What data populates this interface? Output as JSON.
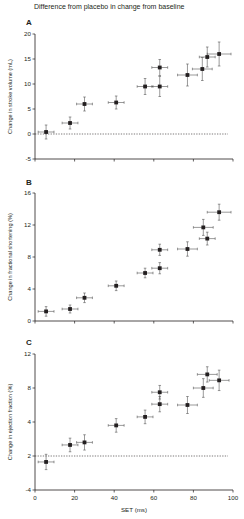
{
  "figure": {
    "title": "Difference from placebo in change from baseline",
    "xlabel": "SET (ms)"
  },
  "chart_data": [
    {
      "type": "scatter",
      "panel": "A",
      "title": "",
      "xlabel": "",
      "ylabel": "Change in stroke volume (mL)",
      "xlim": [
        0,
        100
      ],
      "ylim": [
        -5,
        20
      ],
      "yticks": [
        "-5",
        "0",
        "5",
        "10",
        "15",
        "20"
      ],
      "ytick_values": [
        -5,
        0,
        5,
        10,
        15,
        20
      ],
      "xticks": [
        0,
        20,
        40,
        60,
        80,
        100
      ],
      "xtick_labels_shown": false,
      "reference_line": {
        "y": 0,
        "style": "dashed"
      },
      "points": [
        {
          "x": 5.6,
          "y": 0.4,
          "xerr": 4,
          "yerr": 1.4
        },
        {
          "x": 17.7,
          "y": 2.2,
          "xerr": 4,
          "yerr": 1.2
        },
        {
          "x": 25,
          "y": 6.0,
          "xerr": 4,
          "yerr": 1.4
        },
        {
          "x": 41,
          "y": 6.3,
          "xerr": 4,
          "yerr": 1.3
        },
        {
          "x": 55.6,
          "y": 9.5,
          "xerr": 4,
          "yerr": 1.6
        },
        {
          "x": 63,
          "y": 9.5,
          "xerr": 4,
          "yerr": 2.0
        },
        {
          "x": 63,
          "y": 13.3,
          "xerr": 4,
          "yerr": 1.6
        },
        {
          "x": 77,
          "y": 11.8,
          "xerr": 5,
          "yerr": 2.2
        },
        {
          "x": 84.5,
          "y": 13.0,
          "xerr": 5,
          "yerr": 2.3
        },
        {
          "x": 87,
          "y": 15.4,
          "xerr": 4,
          "yerr": 2.0
        },
        {
          "x": 93,
          "y": 16.0,
          "xerr": 6,
          "yerr": 2.4
        }
      ]
    },
    {
      "type": "scatter",
      "panel": "B",
      "title": "",
      "xlabel": "",
      "ylabel": "Change in fractional shortening (%)",
      "xlim": [
        0,
        100
      ],
      "ylim": [
        0,
        16
      ],
      "yticks": [
        "0",
        "4",
        "8",
        "12",
        "16"
      ],
      "ytick_values": [
        0,
        4,
        8,
        12,
        16
      ],
      "xticks": [
        0,
        20,
        40,
        60,
        80,
        100
      ],
      "xtick_labels_shown": false,
      "points": [
        {
          "x": 5.6,
          "y": 1.2,
          "xerr": 4,
          "yerr": 0.6
        },
        {
          "x": 17.7,
          "y": 1.5,
          "xerr": 4,
          "yerr": 0.5
        },
        {
          "x": 25,
          "y": 2.9,
          "xerr": 4,
          "yerr": 0.6
        },
        {
          "x": 41,
          "y": 4.4,
          "xerr": 4,
          "yerr": 0.6
        },
        {
          "x": 55.6,
          "y": 6.0,
          "xerr": 4,
          "yerr": 0.6
        },
        {
          "x": 63,
          "y": 6.6,
          "xerr": 4,
          "yerr": 0.7
        },
        {
          "x": 63,
          "y": 8.9,
          "xerr": 4,
          "yerr": 0.7
        },
        {
          "x": 77,
          "y": 9.0,
          "xerr": 5,
          "yerr": 0.9
        },
        {
          "x": 85,
          "y": 11.7,
          "xerr": 5,
          "yerr": 1.0
        },
        {
          "x": 87,
          "y": 10.3,
          "xerr": 4,
          "yerr": 0.8
        },
        {
          "x": 93,
          "y": 13.6,
          "xerr": 6,
          "yerr": 1.0
        }
      ]
    },
    {
      "type": "scatter",
      "panel": "C",
      "title": "",
      "xlabel": "SET (ms)",
      "ylabel": "Change in ejection fraction (%)",
      "xlim": [
        0,
        100
      ],
      "ylim": [
        -4,
        12
      ],
      "yticks": [
        "-4",
        "2",
        "4",
        "8",
        "12"
      ],
      "ytick_values": [
        -4,
        0,
        4,
        8,
        12
      ],
      "xticks": [
        0,
        20,
        40,
        60,
        80,
        100
      ],
      "xtick_labels": [
        "0",
        "20",
        "40",
        "60",
        "80",
        "100"
      ],
      "reference_line": {
        "y": 0,
        "style": "dashed"
      },
      "points": [
        {
          "x": 5.6,
          "y": -0.7,
          "xerr": 4,
          "yerr": 0.9
        },
        {
          "x": 17.7,
          "y": 1.3,
          "xerr": 4,
          "yerr": 0.8
        },
        {
          "x": 25,
          "y": 1.6,
          "xerr": 4,
          "yerr": 0.9
        },
        {
          "x": 41,
          "y": 3.6,
          "xerr": 4,
          "yerr": 0.8
        },
        {
          "x": 55.6,
          "y": 4.6,
          "xerr": 4,
          "yerr": 0.8
        },
        {
          "x": 63,
          "y": 6.1,
          "xerr": 4,
          "yerr": 0.9
        },
        {
          "x": 63,
          "y": 7.5,
          "xerr": 4,
          "yerr": 0.8
        },
        {
          "x": 77,
          "y": 6.0,
          "xerr": 5,
          "yerr": 1.0
        },
        {
          "x": 85,
          "y": 8.0,
          "xerr": 5,
          "yerr": 1.1
        },
        {
          "x": 87,
          "y": 9.6,
          "xerr": 5,
          "yerr": 0.9
        },
        {
          "x": 93,
          "y": 8.9,
          "xerr": 5,
          "yerr": 1.2
        }
      ]
    }
  ]
}
